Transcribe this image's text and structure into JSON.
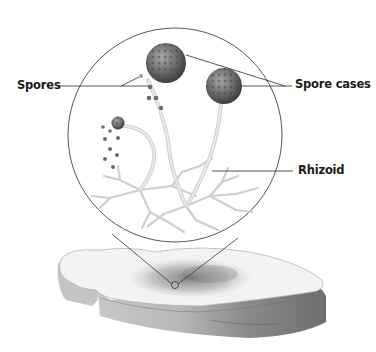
{
  "diagram": {
    "labels": {
      "spores": "Spores",
      "spore_cases": "Spore cases",
      "rhizoid": "Rhizoid"
    },
    "colors": {
      "line": "#333333",
      "sporangium": "#6b6b6b",
      "stalk": "#d8d8d8",
      "rhizoid": "#c8c8c8",
      "bread_top": "#f2f2f2",
      "bread_crust": "#8a8a8a",
      "mold_patch": "#7a7a7a"
    }
  }
}
